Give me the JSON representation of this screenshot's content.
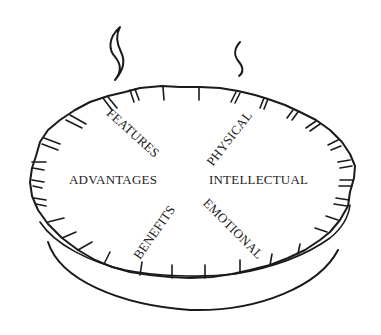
{
  "figure": {
    "segments": [
      {
        "id": "features",
        "label": "FEATURES"
      },
      {
        "id": "physical",
        "label": "PHYSICAL"
      },
      {
        "id": "advantages",
        "label": "ADVANTAGES"
      },
      {
        "id": "intellectual",
        "label": "INTELLECTUAL"
      },
      {
        "id": "benefits",
        "label": "BENEFITS"
      },
      {
        "id": "emotional",
        "label": "EMOTIONAL"
      }
    ],
    "colors": {
      "ink": "#1a1a1a",
      "text": "#222222",
      "background": "#ffffff"
    }
  }
}
